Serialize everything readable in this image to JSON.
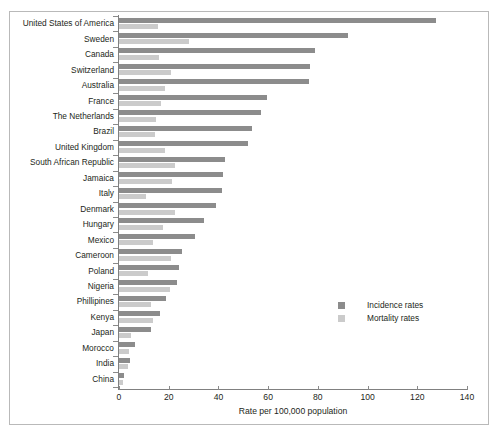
{
  "chart_data": {
    "type": "bar",
    "orientation": "horizontal",
    "title": "",
    "xlabel": "Rate per 100,000 population",
    "ylabel": "",
    "xlim": [
      0,
      140
    ],
    "xticks": [
      0,
      20,
      40,
      60,
      80,
      100,
      120,
      140
    ],
    "grid": false,
    "legend_position": "center-right",
    "categories": [
      "United States of America",
      "Sweden",
      "Canada",
      "Switzerland",
      "Australia",
      "France",
      "The Netherlands",
      "Brazil",
      "United Kingdom",
      "South African Republic",
      "Jamaica",
      "Italy",
      "Denmark",
      "Hungary",
      "Mexico",
      "Cameroon",
      "Poland",
      "Nigeria",
      "Phillipines",
      "Kenya",
      "Japan",
      "Morocco",
      "India",
      "China"
    ],
    "series": [
      {
        "name": "Incidence rates",
        "color": "#8c8c8c",
        "values": [
          127.5,
          92.0,
          79.0,
          77.0,
          76.5,
          59.5,
          57.0,
          53.5,
          52.0,
          42.5,
          42.0,
          41.5,
          39.0,
          34.0,
          30.5,
          25.5,
          24.0,
          23.5,
          19.0,
          16.5,
          13.0,
          6.5,
          4.5,
          2.0
        ]
      },
      {
        "name": "Mortality rates",
        "color": "#cbcbcb",
        "values": [
          15.5,
          28.0,
          16.0,
          21.0,
          18.5,
          17.0,
          15.0,
          14.5,
          18.5,
          22.5,
          21.5,
          11.0,
          22.5,
          17.5,
          13.5,
          21.0,
          11.5,
          20.5,
          13.0,
          13.5,
          5.0,
          4.0,
          3.5,
          1.5
        ]
      }
    ]
  },
  "legend": {
    "items": [
      {
        "label": "Incidence rates"
      },
      {
        "label": "Mortality rates"
      }
    ]
  }
}
